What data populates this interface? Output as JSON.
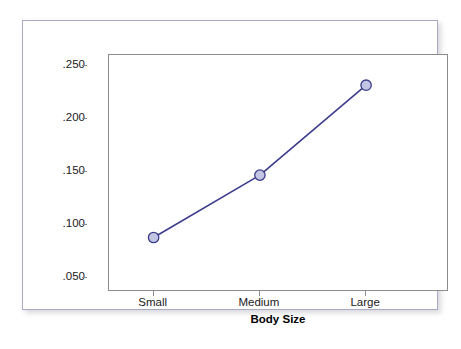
{
  "chart_data": {
    "type": "line",
    "title": "",
    "subtitle": "",
    "xlabel": "Body Size",
    "ylabel": "Probability of Diabetes",
    "categories": [
      "Small",
      "Medium",
      "Large"
    ],
    "values": [
      0.088,
      0.147,
      0.232
    ],
    "value_labels": [
      ".088",
      ".147",
      ".232"
    ],
    "ytick_labels": [
      ".250",
      ".200",
      ".150",
      ".100",
      ".050"
    ],
    "ytick_values": [
      0.25,
      0.2,
      0.15,
      0.1,
      0.05
    ],
    "ylim": [
      0.0365,
      0.2605
    ],
    "grid": false,
    "legend": false,
    "legend_position": "none",
    "series": [
      {
        "name": "Probability of Diabetes",
        "values": [
          0.088,
          0.147,
          0.232
        ]
      }
    ],
    "marker": "circle",
    "colors": {
      "line": "#3c3c8c",
      "marker_fill": "#c3c6e3",
      "marker_edge": "#3c3c8c",
      "panel_border": "#8c8c8c",
      "figure_border": "#a9abc5",
      "background": "#ffffff",
      "text": "#1a1a1a"
    }
  },
  "axes": {
    "y": {
      "title": "Probability of Diabetes",
      "ticks": [
        {
          "label": ".250",
          "value": 0.25
        },
        {
          "label": ".200",
          "value": 0.2
        },
        {
          "label": ".150",
          "value": 0.15
        },
        {
          "label": ".100",
          "value": 0.1
        },
        {
          "label": ".050",
          "value": 0.05
        }
      ]
    },
    "x": {
      "title": "Body Size",
      "ticks": [
        {
          "label": "Small"
        },
        {
          "label": "Medium"
        },
        {
          "label": "Large"
        }
      ]
    }
  }
}
